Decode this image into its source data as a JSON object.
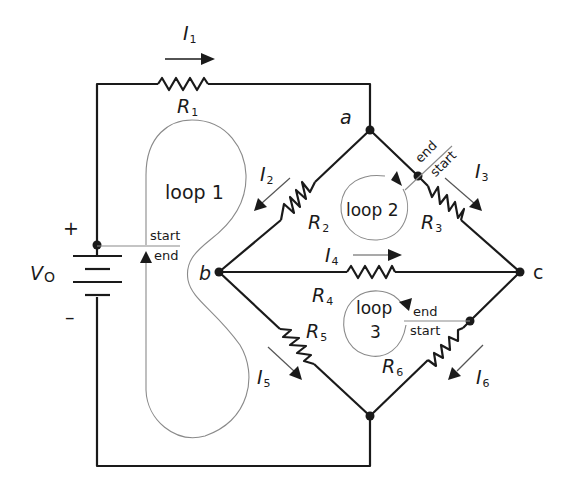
{
  "diagram": {
    "type": "circuit",
    "source": {
      "label": "V",
      "subscript": "O",
      "plus": "+",
      "minus": "–"
    },
    "nodes": {
      "a": "a",
      "b": "b",
      "c": "c"
    },
    "resistors": [
      {
        "id": "R1",
        "label": "R",
        "sub": "1"
      },
      {
        "id": "R2",
        "label": "R",
        "sub": "2"
      },
      {
        "id": "R3",
        "label": "R",
        "sub": "3"
      },
      {
        "id": "R4",
        "label": "R",
        "sub": "4"
      },
      {
        "id": "R5",
        "label": "R",
        "sub": "5"
      },
      {
        "id": "R6",
        "label": "R",
        "sub": "6"
      }
    ],
    "currents": [
      {
        "id": "I1",
        "label": "I",
        "sub": "1"
      },
      {
        "id": "I2",
        "label": "I",
        "sub": "2"
      },
      {
        "id": "I3",
        "label": "I",
        "sub": "3"
      },
      {
        "id": "I4",
        "label": "I",
        "sub": "4"
      },
      {
        "id": "I5",
        "label": "I",
        "sub": "5"
      },
      {
        "id": "I6",
        "label": "I",
        "sub": "6"
      }
    ],
    "loops": [
      {
        "id": "loop1",
        "label": "loop 1",
        "start": "start",
        "end": "end"
      },
      {
        "id": "loop2",
        "label": "loop 2",
        "start": "start",
        "end": "end"
      },
      {
        "id": "loop3",
        "label_line1": "loop",
        "label_line2": "3",
        "start": "start",
        "end": "end"
      }
    ],
    "colors": {
      "wire": "#1a1a1a",
      "loop_path": "#8a8a8a",
      "background": "#ffffff"
    }
  }
}
